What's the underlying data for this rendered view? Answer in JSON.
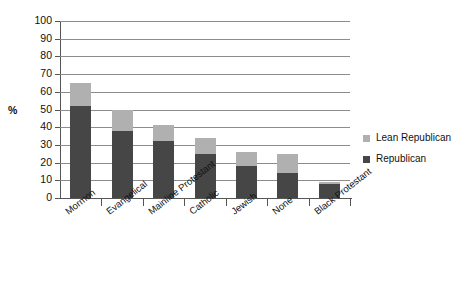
{
  "chart_data": {
    "type": "bar",
    "subtype": "stacked-vertical",
    "title": "",
    "xlabel": "",
    "ylabel": "%",
    "ylim": [
      0,
      100
    ],
    "y_ticks": [
      0,
      10,
      20,
      30,
      40,
      50,
      60,
      70,
      80,
      90,
      100
    ],
    "grid": true,
    "legend_position": "right",
    "categories": [
      "Mormon",
      "Evangelical",
      "Mainline Protestant",
      "Catholic",
      "Jewish",
      "None",
      "Black Protestant"
    ],
    "series": [
      {
        "name": "Republican",
        "color": "#464646",
        "values": [
          52,
          38,
          32,
          25,
          18,
          14,
          8
        ]
      },
      {
        "name": "Lean Republican",
        "color": "#b0b0b0",
        "values": [
          13,
          12,
          9,
          9,
          8,
          11,
          1
        ]
      }
    ],
    "totals": [
      65,
      50,
      41,
      34,
      26,
      25,
      9
    ],
    "stack_order_bottom_to_top": [
      "Republican",
      "Lean Republican"
    ]
  },
  "legend": {
    "items": [
      {
        "label": "Lean Republican",
        "color": "#b0b0b0"
      },
      {
        "label": "Republican",
        "color": "#464646"
      }
    ]
  },
  "axis": {
    "y_title": "%",
    "y_tick_labels": [
      "100",
      "90",
      "80",
      "70",
      "60",
      "50",
      "40",
      "30",
      "20",
      "10",
      "0"
    ]
  }
}
